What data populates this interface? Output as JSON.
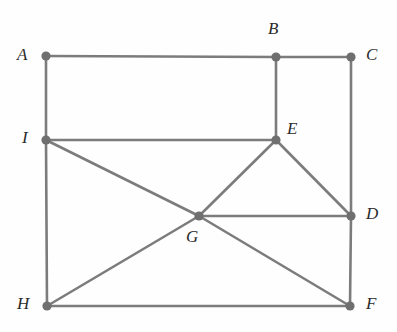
{
  "figure": {
    "background_color": "#fefefe",
    "edge_color": "#7c7c7c",
    "vertex_color": "#6f6f6f",
    "label_color": "#2b2b2b",
    "width": 397,
    "height": 332
  },
  "chart_data": {
    "type": "diagram",
    "subtype": "graph",
    "title": "",
    "vertices": [
      {
        "id": "A",
        "label": "A",
        "x": 46,
        "y": 56,
        "label_x": 17,
        "label_y": 46
      },
      {
        "id": "B",
        "label": "B",
        "x": 276,
        "y": 57,
        "label_x": 268,
        "label_y": 20
      },
      {
        "id": "C",
        "label": "C",
        "x": 351,
        "y": 57,
        "label_x": 366,
        "label_y": 46
      },
      {
        "id": "D",
        "label": "D",
        "x": 351,
        "y": 216,
        "label_x": 366,
        "label_y": 205
      },
      {
        "id": "E",
        "label": "E",
        "x": 276,
        "y": 140,
        "label_x": 287,
        "label_y": 120
      },
      {
        "id": "F",
        "label": "F",
        "x": 350,
        "y": 306,
        "label_x": 366,
        "label_y": 295
      },
      {
        "id": "G",
        "label": "G",
        "x": 199,
        "y": 216,
        "label_x": 186,
        "label_y": 228
      },
      {
        "id": "H",
        "label": "H",
        "x": 47,
        "y": 306,
        "label_x": 17,
        "label_y": 295
      },
      {
        "id": "I",
        "label": "I",
        "x": 46,
        "y": 140,
        "label_x": 22,
        "label_y": 129
      }
    ],
    "edges": [
      {
        "from": "A",
        "to": "B"
      },
      {
        "from": "B",
        "to": "C"
      },
      {
        "from": "A",
        "to": "I"
      },
      {
        "from": "I",
        "to": "H"
      },
      {
        "from": "C",
        "to": "D"
      },
      {
        "from": "D",
        "to": "F"
      },
      {
        "from": "B",
        "to": "E"
      },
      {
        "from": "I",
        "to": "E"
      },
      {
        "from": "I",
        "to": "G"
      },
      {
        "from": "E",
        "to": "G"
      },
      {
        "from": "E",
        "to": "D"
      },
      {
        "from": "G",
        "to": "D"
      },
      {
        "from": "G",
        "to": "H"
      },
      {
        "from": "G",
        "to": "F"
      },
      {
        "from": "H",
        "to": "F"
      }
    ],
    "vertex_radius": 4.6
  }
}
